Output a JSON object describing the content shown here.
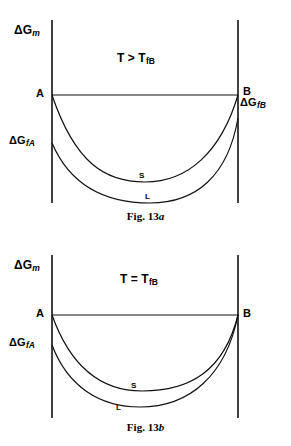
{
  "figure": {
    "axis_label_y": {
      "symbol": "ΔG",
      "subscript": "m",
      "full": "ΔGm"
    },
    "panels": [
      {
        "id": "a",
        "caption_prefix": "Fig. 13",
        "caption_suffix": "a",
        "caption_full": "Fig. 13a",
        "condition": {
          "left": "T",
          "operator": ">",
          "right_symbol": "T",
          "right_subscript": "fB",
          "full": "T > TfB"
        },
        "point_a_label": "A",
        "point_b_label": "B",
        "left_energy_label": {
          "symbol": "ΔG",
          "subscript": "fA",
          "full": "ΔGfA"
        },
        "right_energy_label": {
          "symbol": "ΔG",
          "subscript": "fB",
          "full": "ΔGfB"
        },
        "curve_solid_label": "S",
        "curve_liquid_label": "L"
      },
      {
        "id": "b",
        "caption_prefix": "Fig. 13",
        "caption_suffix": "b",
        "caption_full": "Fig. 13b",
        "condition": {
          "left": "T",
          "operator": "=",
          "right_symbol": "T",
          "right_subscript": "fB",
          "full": "T = TfB"
        },
        "point_a_label": "A",
        "point_b_label": "B",
        "left_energy_label": {
          "symbol": "ΔG",
          "subscript": "fA",
          "full": "ΔGfA"
        },
        "curve_solid_label": "S",
        "curve_liquid_label": "L"
      }
    ],
    "colors": {
      "ink": "#111111",
      "background": "#ffffff"
    }
  }
}
